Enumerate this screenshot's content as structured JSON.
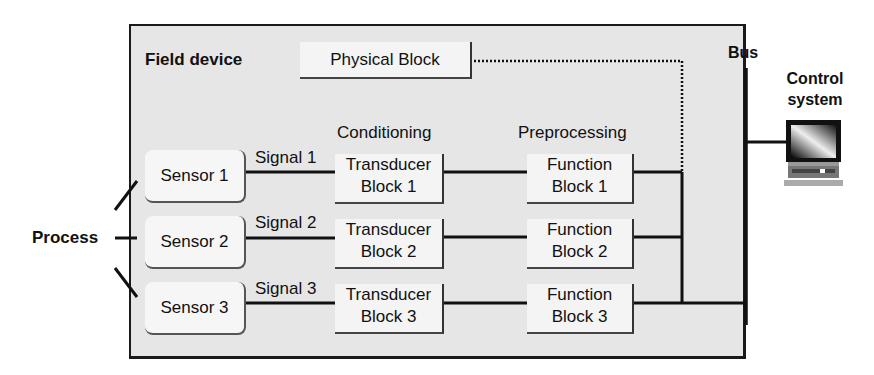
{
  "diagram": {
    "container_label": "Field device",
    "physical_block": "Physical Block",
    "column_headers": {
      "conditioning": "Conditioning",
      "preprocessing": "Preprocessing"
    },
    "process_label": "Process",
    "bus_label": "Bus",
    "control_system": {
      "line1": "Control",
      "line2": "system"
    },
    "rows": [
      {
        "sensor": "Sensor 1",
        "signal": "Signal 1",
        "transducer": [
          "Transducer",
          "Block 1"
        ],
        "function": [
          "Function",
          "Block 1"
        ]
      },
      {
        "sensor": "Sensor 2",
        "signal": "Signal 2",
        "transducer": [
          "Transducer",
          "Block 2"
        ],
        "function": [
          "Function",
          "Block 2"
        ]
      },
      {
        "sensor": "Sensor 3",
        "signal": "Signal 3",
        "transducer": [
          "Transducer",
          "Block 3"
        ],
        "function": [
          "Function",
          "Block 3"
        ]
      }
    ],
    "colors": {
      "container_bg": "#e6e6e6",
      "line": "#111111",
      "block_bg": "#f4f4f4"
    }
  }
}
